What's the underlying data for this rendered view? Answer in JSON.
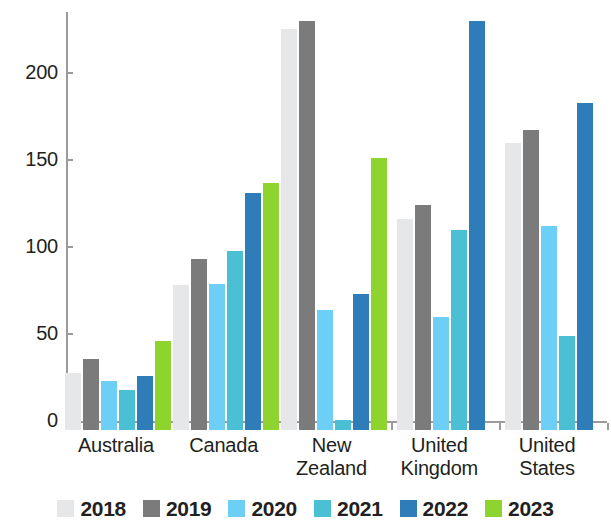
{
  "chart_data": {
    "type": "bar",
    "title": "",
    "subtitle": "",
    "xlabel": "",
    "ylabel": "",
    "categories": [
      "Australia",
      "Canada",
      "New Zealand",
      "United Kingdom",
      "United States"
    ],
    "series": [
      {
        "name": "2018",
        "color": "#e6e7e8",
        "values": [
          33,
          83,
          230,
          121,
          165
        ]
      },
      {
        "name": "2019",
        "color": "#7b7b7b",
        "values": [
          41,
          98,
          235,
          129,
          172
        ]
      },
      {
        "name": "2020",
        "color": "#6ecff6",
        "values": [
          28,
          84,
          69,
          65,
          117
        ]
      },
      {
        "name": "2021",
        "color": "#4bbfd4",
        "values": [
          23,
          103,
          6,
          115,
          54
        ]
      },
      {
        "name": "2022",
        "color": "#2e7db8",
        "values": [
          31,
          136,
          78,
          235,
          188
        ]
      },
      {
        "name": "2023",
        "color": "#8dd42e",
        "values": [
          51,
          142,
          156,
          null,
          null
        ]
      }
    ],
    "ylim": [
      0,
      245
    ],
    "yticks": [
      0,
      50,
      100,
      150,
      200
    ],
    "ytick_labels": [
      "0",
      "50",
      "100",
      "150",
      "200"
    ],
    "grid": false,
    "legend_position": "bottom",
    "axis_color": "#9b9b9b"
  },
  "legend": {
    "entries": [
      "2018",
      "2019",
      "2020",
      "2021",
      "2022",
      "2023"
    ]
  }
}
